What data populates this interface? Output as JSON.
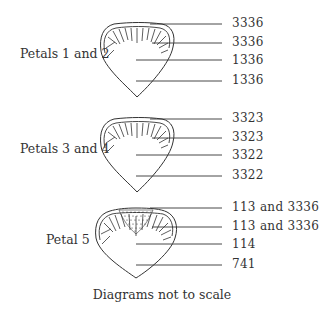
{
  "diagram": {
    "caption": "Diagrams not to scale",
    "groups": [
      {
        "label": "Petals 1 and 2",
        "codes": [
          "3336",
          "3336",
          "1336",
          "1336"
        ]
      },
      {
        "label": "Petals 3 and 4",
        "codes": [
          "3323",
          "3323",
          "3322",
          "3322"
        ]
      },
      {
        "label": "Petal 5",
        "codes": [
          "113 and 3336",
          "113 and 3336",
          "114",
          "741"
        ]
      }
    ],
    "colors": {
      "ink": "#333333",
      "background": "#ffffff"
    }
  }
}
